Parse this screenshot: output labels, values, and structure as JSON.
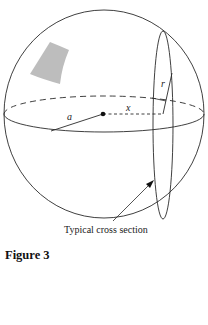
{
  "figure": {
    "title": "Figure 3",
    "caption": "Typical cross section",
    "labels": {
      "radius_sphere": "a",
      "distance_from_center": "x",
      "radius_cross_section": "r"
    },
    "colors": {
      "stroke": "#2a2a2a",
      "shaded_patch": "#bdbdbd",
      "background": "#ffffff"
    },
    "elements": [
      "sphere-outline",
      "equator-ellipse",
      "center-point",
      "cross-section-ellipse",
      "shaded-surface-patch",
      "arrow-to-cross-section"
    ]
  }
}
